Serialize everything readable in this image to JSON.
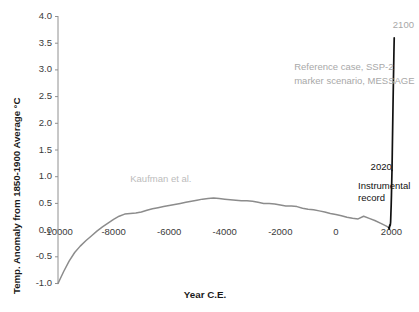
{
  "chart_data": {
    "type": "line",
    "title": "",
    "xlabel": "Year C.E.",
    "ylabel": "Temp. Anomaly from 1850-1900 Average °C",
    "xlim": [
      -10000,
      2200
    ],
    "ylim": [
      -1.0,
      4.0
    ],
    "grid": false,
    "legend_position": "none",
    "xticks": [
      -10000,
      -8000,
      -6000,
      -4000,
      -2000,
      0,
      2000
    ],
    "xtick_labels": [
      "-10000",
      "-8000",
      "-6000",
      "-4000",
      "-2000",
      "0",
      "2000"
    ],
    "yticks": [
      4.0,
      3.5,
      3.0,
      2.5,
      2.0,
      1.5,
      1.0,
      0.5,
      0.0,
      -0.5,
      -1.0
    ],
    "ytick_labels": [
      "4.0",
      "3.5",
      "3.0",
      "2.5",
      "2.0",
      "1.5",
      "1.0",
      "0.5",
      "0.0",
      "-0.5",
      "-1.0"
    ],
    "series": [
      {
        "name": "Kaufman et al.",
        "color": "#8c8c8c",
        "x": [
          -10000,
          -9800,
          -9600,
          -9400,
          -9200,
          -9000,
          -8800,
          -8600,
          -8400,
          -8200,
          -8000,
          -7800,
          -7600,
          -7400,
          -7200,
          -7000,
          -6800,
          -6600,
          -6400,
          -6200,
          -6000,
          -5800,
          -5600,
          -5400,
          -5200,
          -5000,
          -4800,
          -4600,
          -4400,
          -4200,
          -4000,
          -3800,
          -3600,
          -3400,
          -3200,
          -3000,
          -2800,
          -2600,
          -2400,
          -2200,
          -2000,
          -1800,
          -1600,
          -1400,
          -1200,
          -1000,
          -800,
          -600,
          -400,
          -200,
          0,
          200,
          400,
          600,
          800,
          1000,
          1200,
          1400,
          1600,
          1800,
          1900
        ],
        "y": [
          -1.0,
          -0.78,
          -0.58,
          -0.42,
          -0.3,
          -0.2,
          -0.11,
          -0.02,
          0.06,
          0.13,
          0.2,
          0.26,
          0.3,
          0.31,
          0.32,
          0.34,
          0.37,
          0.4,
          0.42,
          0.44,
          0.46,
          0.48,
          0.5,
          0.52,
          0.54,
          0.56,
          0.58,
          0.59,
          0.6,
          0.59,
          0.58,
          0.57,
          0.56,
          0.55,
          0.55,
          0.54,
          0.52,
          0.5,
          0.5,
          0.49,
          0.47,
          0.45,
          0.45,
          0.44,
          0.41,
          0.39,
          0.38,
          0.36,
          0.34,
          0.31,
          0.29,
          0.27,
          0.24,
          0.22,
          0.21,
          0.26,
          0.22,
          0.18,
          0.13,
          0.08,
          0.05
        ]
      },
      {
        "name": "Instrumental record",
        "color": "#111111",
        "x": [
          1900,
          1920,
          1940,
          1950,
          1960,
          1970,
          1980,
          1990,
          2000,
          2010,
          2020
        ],
        "y": [
          0.05,
          0.02,
          0.1,
          0.08,
          0.1,
          0.15,
          0.3,
          0.45,
          0.65,
          0.9,
          1.12
        ]
      },
      {
        "name": "Reference case, SSP-2 marker scenario, MESSAGE",
        "color": "#111111",
        "x": [
          2020,
          2030,
          2040,
          2050,
          2060,
          2070,
          2080,
          2090,
          2100
        ],
        "y": [
          1.12,
          1.45,
          1.78,
          2.12,
          2.45,
          2.76,
          3.05,
          3.35,
          3.6
        ]
      }
    ],
    "annotations": [
      {
        "id": "kaufman",
        "text": "Kaufman et al.",
        "color": "#bcbcbc",
        "x": -7400,
        "y": 0.95
      },
      {
        "id": "reference-case-line1",
        "text": "Reference case, SSP-2",
        "color": "#a8a8a8",
        "x": -1500,
        "y": 3.05
      },
      {
        "id": "reference-case-line2",
        "text": "marker scenario, MESSAGE",
        "color": "#a8a8a8",
        "x": -1500,
        "y": 2.8
      },
      {
        "id": "year-2100",
        "text": "2100",
        "color": "#a8a8a8",
        "x": 2050,
        "y": 3.85
      },
      {
        "id": "year-2020",
        "text": "2020",
        "color": "#111111",
        "x": 1250,
        "y": 1.18
      },
      {
        "id": "instrumental-line1",
        "text": "Instrumental",
        "color": "#111111",
        "x": 800,
        "y": 0.82
      },
      {
        "id": "instrumental-line2",
        "text": "record",
        "color": "#111111",
        "x": 800,
        "y": 0.6
      }
    ]
  },
  "axes": {
    "y_axis_title": "Temp. Anomaly from 1850-1900 Average °C",
    "x_axis_title": "Year C.E."
  }
}
